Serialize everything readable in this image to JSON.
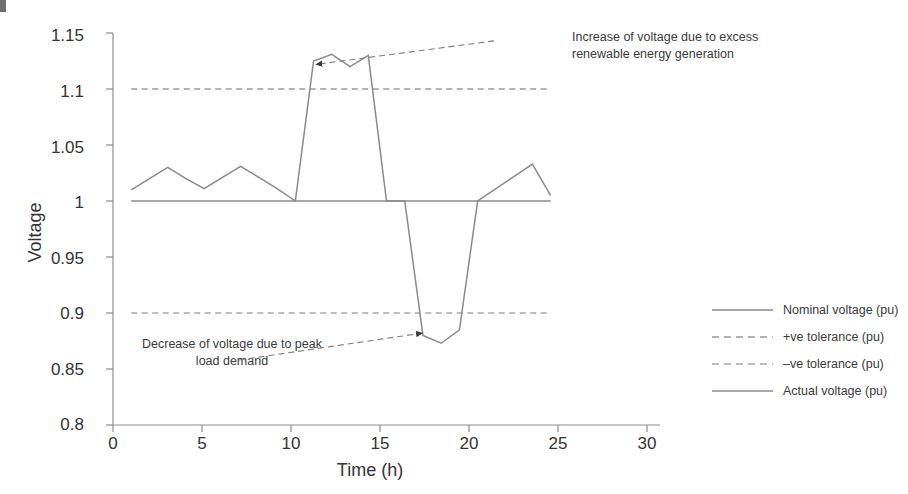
{
  "chart_data": {
    "type": "line",
    "title": "",
    "xlabel": "Time (h)",
    "ylabel": "Voltage",
    "xlim": [
      0,
      30
    ],
    "ylim": [
      0.8,
      1.15
    ],
    "xticks": [
      0,
      5,
      10,
      15,
      20,
      25,
      30
    ],
    "yticks": [
      0.8,
      0.85,
      0.9,
      0.95,
      1,
      1.05,
      1.1,
      1.15
    ],
    "xtick_labels": [
      "0",
      "5",
      "10",
      "15",
      "20",
      "25",
      "30"
    ],
    "ytick_labels": [
      "0.8",
      "0.85",
      "0.9",
      "0.95",
      "1",
      "1.05",
      "1.1",
      "1.15"
    ],
    "grid": false,
    "legend_position": "outside-right",
    "series": [
      {
        "name": "Nominal voltage (pu)",
        "style": "solid",
        "color": "#8a8a8a",
        "x": [
          1,
          24
        ],
        "values": [
          1.0,
          1.0
        ]
      },
      {
        "name": "+ve tolerance (pu)",
        "style": "dashed",
        "color": "#9a9a9a",
        "x": [
          1,
          24
        ],
        "values": [
          1.1,
          1.1
        ]
      },
      {
        "name": "-ve tolerance (pu)",
        "style": "dashed",
        "color": "#a8a8a8",
        "x": [
          1,
          24
        ],
        "values": [
          0.9,
          0.9
        ]
      },
      {
        "name": "Actual voltage (pu)",
        "style": "solid",
        "color": "#8a8a8a",
        "x": [
          1,
          2,
          3,
          4,
          5,
          6,
          7,
          8,
          9,
          10,
          11,
          12,
          13,
          14,
          15,
          16,
          17,
          18,
          19,
          20,
          21,
          22,
          23,
          24
        ],
        "values": [
          1.01,
          1.02,
          1.03,
          1.02,
          1.011,
          1.021,
          1.031,
          1.021,
          1.011,
          1.0,
          1.125,
          1.131,
          1.12,
          1.13,
          1.0,
          1.0,
          0.88,
          0.873,
          0.885,
          1.0,
          1.011,
          1.022,
          1.033,
          1.005
        ]
      }
    ],
    "annotations": [
      {
        "name": "increase-annotation",
        "text": "Increase of voltage due to excess\nrenewable energy generation",
        "point_x": 11.15,
        "point_y": 1.122,
        "text_x": 20.9,
        "text_y": 1.143
      },
      {
        "name": "decrease-annotation",
        "text": "Decrease of voltage due to peak\nload demand",
        "point_x": 16.95,
        "point_y": 0.882,
        "text_x": 6.9,
        "text_y": 0.858
      }
    ]
  },
  "legend": {
    "items": [
      {
        "label": "Nominal voltage (pu)",
        "style": "solid",
        "color": "#8a8a8a"
      },
      {
        "label": "+ve tolerance (pu)",
        "style": "dashed",
        "color": "#9a9a9a"
      },
      {
        "label": "–ve tolerance (pu)",
        "style": "dashed",
        "color": "#a8a8a8"
      },
      {
        "label": "Actual voltage (pu)",
        "style": "solid",
        "color": "#8a8a8a"
      }
    ]
  },
  "axes": {
    "y_title": "Voltage",
    "x_title": "Time (h)"
  },
  "colors": {
    "axis": "#8d8d8d",
    "text": "#333333",
    "series": "#8a8a8a",
    "tolerance_pos": "#9a9a9a",
    "tolerance_neg": "#a8a8a8",
    "background": "#ffffff"
  }
}
